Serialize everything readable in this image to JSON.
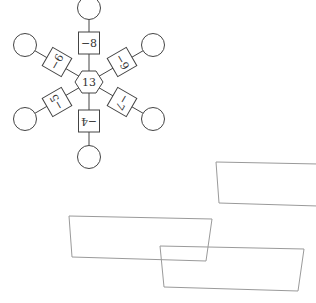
{
  "diagram": {
    "center": {
      "label": "13",
      "shape": "hexagon",
      "x": 89,
      "y": 82
    },
    "arms": [
      {
        "label": "−8",
        "angle": -90,
        "box": [
          89,
          43
        ],
        "circle": [
          89,
          8
        ]
      },
      {
        "label": "−9",
        "angle": -30,
        "box": [
          122,
          62
        ],
        "circle": [
          153,
          45
        ]
      },
      {
        "label": "−7",
        "angle": 30,
        "box": [
          122,
          102
        ],
        "circle": [
          153,
          119
        ]
      },
      {
        "label": "−4",
        "angle": 90,
        "box": [
          89,
          121
        ],
        "circle": [
          89,
          157
        ]
      },
      {
        "label": "−5",
        "angle": 150,
        "box": [
          57,
          102
        ],
        "circle": [
          25,
          119
        ]
      },
      {
        "label": "−6",
        "angle": 210,
        "box": [
          57,
          62
        ],
        "circle": [
          25,
          45
        ]
      }
    ],
    "colors": {
      "stroke": "#444444",
      "quad_stroke": "#9a9a9a",
      "background": "#ffffff"
    }
  },
  "quads": [
    {
      "points": "216,162 318,164 318,206 219,203"
    },
    {
      "points": "69,216 212,219 206,261 72,257"
    },
    {
      "points": "160,246 304,249 298,291 164,287"
    }
  ]
}
